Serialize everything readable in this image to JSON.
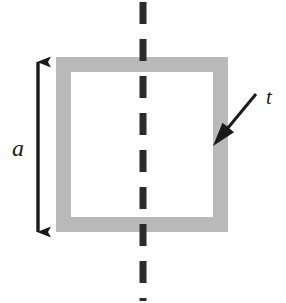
{
  "figure": {
    "kind": "engineering-cross-section-diagram",
    "background_color": "#ffffff",
    "canvas": {
      "width": 286,
      "height": 303
    }
  },
  "shape": {
    "name": "square-tube-cross-section",
    "type": "hollow-square",
    "wall_color": "#b9b9b9",
    "interior_color": "#ffffff",
    "outer": {
      "x": 56,
      "y": 57,
      "width": 172,
      "height": 175
    },
    "wall_thickness_px": 15,
    "inner": {
      "x": 71,
      "y": 72,
      "width": 142,
      "height": 145
    }
  },
  "dimension": {
    "name": "side-length-dimension",
    "label": "a",
    "description": "overall outer side length of the square",
    "orientation": "vertical",
    "style": "double-headed-arrow",
    "color": "#1a1a1a",
    "x": 38,
    "y_start": 60,
    "y_end": 234,
    "label_position": {
      "x": 18,
      "y": 156
    }
  },
  "thickness_callout": {
    "name": "wall-thickness-callout",
    "label": "t",
    "description": "leader arrow pointing to the wall thickness",
    "style": "single-headed-leader-arrow",
    "color": "#1a1a1a",
    "tail": {
      "x": 256,
      "y": 94
    },
    "tip": {
      "x": 213,
      "y": 146
    },
    "label_position": {
      "x": 266,
      "y": 104
    }
  },
  "centerline": {
    "name": "vertical-axis-of-symmetry",
    "style": "dashed",
    "color": "#2b2b2b",
    "x": 143,
    "y_start": 0,
    "y_end": 303,
    "stroke_width_px": 7,
    "dash_length_px": 22,
    "gap_length_px": 15
  }
}
